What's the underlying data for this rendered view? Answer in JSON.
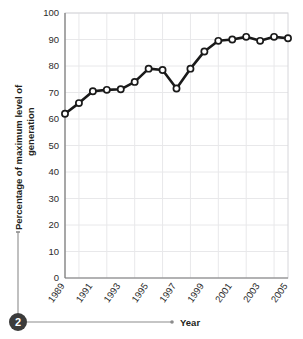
{
  "chart_data": {
    "type": "line",
    "title": "",
    "xlabel": "Year",
    "ylabel": "Percentage of maximum level of generation",
    "ylim": [
      0,
      100
    ],
    "xlim": [
      1989,
      2005
    ],
    "ytick_step": 10,
    "grid": true,
    "legend": "none",
    "marker": "open-circle",
    "line_color": "#1a1a1a",
    "marker_fill": "#ffffff",
    "grid_color": "#e8e8ea",
    "x": [
      1989,
      1990,
      1991,
      1992,
      1993,
      1994,
      1995,
      1996,
      1997,
      1998,
      1999,
      2000,
      2001,
      2002,
      2003,
      2004,
      2005
    ],
    "values": [
      62,
      66,
      70.5,
      71,
      71.2,
      74,
      79,
      78.5,
      71.5,
      79,
      85.5,
      89.5,
      90,
      91,
      89.5,
      91,
      90.5
    ],
    "ytick_labels": [
      "0",
      "10",
      "20",
      "30",
      "40",
      "50",
      "60",
      "70",
      "80",
      "90",
      "100"
    ],
    "ytick_values": [
      0,
      10,
      20,
      30,
      40,
      50,
      60,
      70,
      80,
      90,
      100
    ],
    "xtick_labels": [
      "1989",
      "1991",
      "1993",
      "1995",
      "1997",
      "1999",
      "2001",
      "2003",
      "2005"
    ],
    "xtick_values": [
      1989,
      1991,
      1993,
      1995,
      1997,
      1999,
      2001,
      2003,
      2005
    ]
  },
  "axis": {
    "y_title_line1": "Percentage of maximum level of",
    "y_title_line2": "generation",
    "x_title": "Year"
  },
  "callout": {
    "number": "2",
    "badge_color": "#3b3b3b",
    "leader_color": "#8c8c8c"
  }
}
